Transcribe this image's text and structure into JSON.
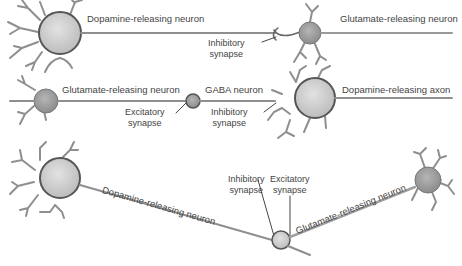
{
  "diagram": {
    "row1": {
      "neuron_a": "Dopamine-releasing neuron",
      "synapse": [
        "Inhibitory",
        "synapse"
      ],
      "neuron_b": "Glutamate-releasing neuron"
    },
    "row2": {
      "neuron_a": "Glutamate-releasing neuron",
      "excitatory": [
        "Excitatory",
        "synapse"
      ],
      "gaba": "GABA neuron",
      "inhibitory": [
        "Inhibitory",
        "synapse"
      ],
      "axon": "Dopamine-releasing axon"
    },
    "row3": {
      "neuron_a": "Dopamine-releasing neuron",
      "inhibitory": [
        "Inhibitory",
        "synapse"
      ],
      "excitatory": [
        "Excitatory",
        "synapse"
      ],
      "neuron_b": "Glutamate-releasing neuron"
    },
    "colors": {
      "axon": "#8a8a8a",
      "soma_light": "#d4d4d4",
      "soma_dark": "#9a9a9a",
      "outline": "#555555"
    }
  }
}
